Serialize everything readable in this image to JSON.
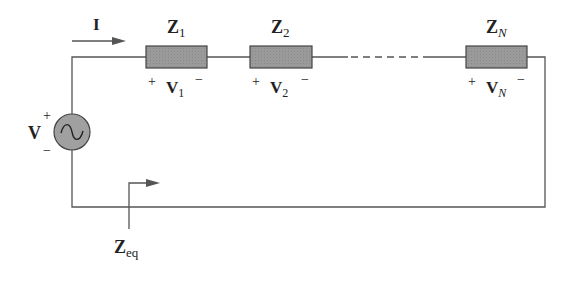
{
  "diagram": {
    "type": "series-impedance-circuit",
    "current": {
      "label": "I"
    },
    "source": {
      "label": "V",
      "plus": "+",
      "minus": "−",
      "symbol": "~"
    },
    "impedances": [
      {
        "name": "Z",
        "sub": "1",
        "vname": "V",
        "vsub": "1",
        "plus": "+",
        "minus": "−"
      },
      {
        "name": "Z",
        "sub": "2",
        "vname": "V",
        "vsub": "2",
        "plus": "+",
        "minus": "−"
      },
      {
        "name": "Z",
        "sub": "N",
        "vname": "V",
        "vsub": "N",
        "plus": "+",
        "minus": "−"
      }
    ],
    "equivalent": {
      "name": "Z",
      "sub": "eq"
    },
    "colors": {
      "wire": "#555555",
      "box_fill": "#9a9a9a",
      "box_stroke": "#444444",
      "source_fill": "#a0a0a0",
      "text": "#222222"
    }
  }
}
